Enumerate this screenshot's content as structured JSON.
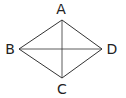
{
  "diagram": {
    "type": "rhombus-with-diagonals",
    "vertices": [
      {
        "id": "A",
        "label": "A",
        "x": 62,
        "y": 20,
        "lx": 61,
        "ly": 14
      },
      {
        "id": "B",
        "label": "B",
        "x": 19,
        "y": 49,
        "lx": 10,
        "ly": 54
      },
      {
        "id": "C",
        "label": "C",
        "x": 62,
        "y": 78,
        "lx": 62,
        "ly": 94
      },
      {
        "id": "D",
        "label": "D",
        "x": 102,
        "y": 49,
        "lx": 112,
        "ly": 54
      }
    ],
    "edges": [
      [
        "A",
        "B"
      ],
      [
        "B",
        "C"
      ],
      [
        "C",
        "D"
      ],
      [
        "D",
        "A"
      ]
    ],
    "diagonals": [
      [
        "A",
        "C"
      ],
      [
        "B",
        "D"
      ]
    ],
    "stroke_color": "#333333"
  }
}
